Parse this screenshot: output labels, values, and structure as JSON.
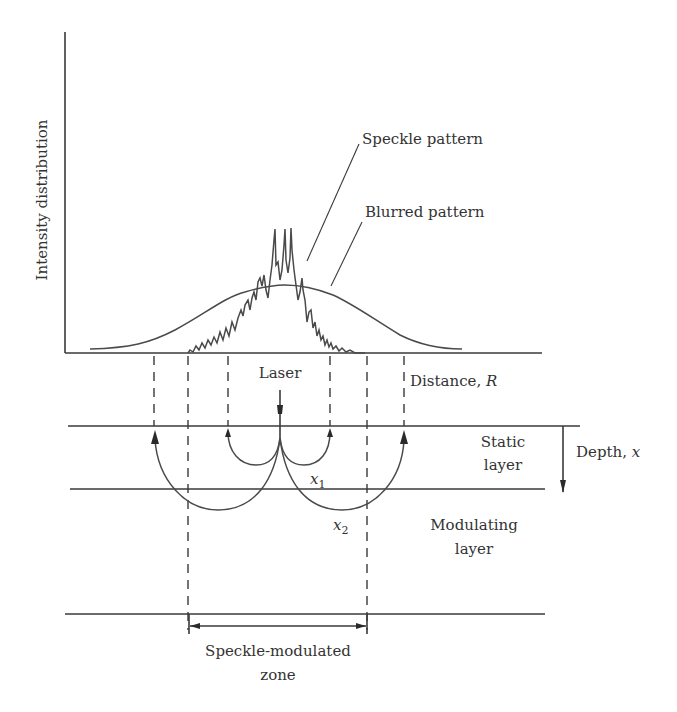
{
  "figure": {
    "type": "laser speckle depth diagram",
    "y_axis_label": "Intensity distribution",
    "curves": {
      "speckle_label": "Speckle pattern",
      "blurred_label": "Blurred pattern"
    },
    "labels": {
      "laser": "Laser",
      "distance": "Distance, ",
      "distance_var": "R",
      "depth": "Depth, ",
      "depth_var": "x",
      "static_layer_line1": "Static",
      "static_layer_line2": "layer",
      "modulating_layer_line1": "Modulating",
      "modulating_layer_line2": "layer",
      "x1_var": "x",
      "x1_sub": "1",
      "x2_var": "x",
      "x2_sub": "2",
      "zone_line1": "Speckle-modulated",
      "zone_line2": "zone"
    },
    "colors": {
      "line": "#3a3a3a",
      "text": "#333333",
      "background": "#ffffff"
    }
  }
}
